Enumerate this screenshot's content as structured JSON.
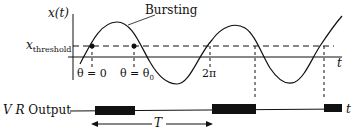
{
  "labels": {
    "y_axis": "x(t)",
    "x_axis": "t",
    "bursting": "Bursting",
    "threshold": "x",
    "threshold_sub": "threshold",
    "theta0": "θ = 0",
    "theta_theta0": "θ = θ",
    "theta0_sub": "0",
    "two_pi": "2π",
    "vr_output": "V R",
    "vr_output_word": "Output",
    "output_t": "t",
    "period": "T"
  },
  "colors": {
    "stroke": "#111111",
    "background": "#ffffff"
  }
}
